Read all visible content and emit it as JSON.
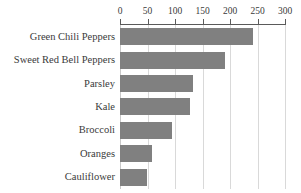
{
  "chart_data": {
    "type": "bar",
    "orientation": "horizontal",
    "title": "",
    "subtitle": "",
    "xlabel": "",
    "ylabel": "",
    "xlim": [
      0,
      300
    ],
    "ylim": null,
    "grid": true,
    "legend": null,
    "legend_position": "none",
    "axis_position": "top",
    "bar_color": "#808080",
    "gridline_color": "#d9d9d9",
    "axis_color": "#5a5a5a",
    "background_color": "#ffffff",
    "xticks": [
      0,
      50,
      100,
      150,
      200,
      250,
      300
    ],
    "xtick_labels": [
      "0",
      "50",
      "100",
      "150",
      "200",
      "250",
      "300"
    ],
    "categories": [
      "Green Chili Peppers",
      "Sweet Red Bell Peppers",
      "Parsley",
      "Kale",
      "Broccoli",
      "Oranges",
      "Cauliflower"
    ],
    "values": [
      242,
      190,
      133,
      127,
      95,
      58,
      49
    ],
    "bars": [
      {
        "label": "Green Chili Peppers",
        "value": 242
      },
      {
        "label": "Sweet Red Bell Peppers",
        "value": 190
      },
      {
        "label": "Parsley",
        "value": 133
      },
      {
        "label": "Kale",
        "value": 127
      },
      {
        "label": "Broccoli",
        "value": 95
      },
      {
        "label": "Oranges",
        "value": 58
      },
      {
        "label": "Cauliflower",
        "value": 49
      }
    ]
  }
}
